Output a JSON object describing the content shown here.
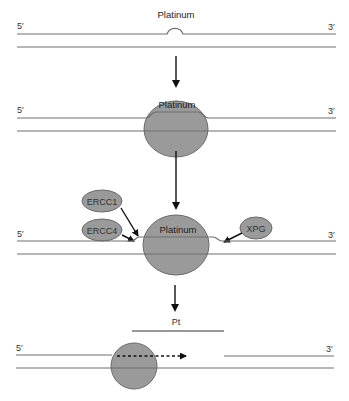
{
  "diagram": {
    "colors": {
      "protein_fill": "#9a9a9a",
      "protein_stroke": "#6a6a6a",
      "strand": "#6e6e6e",
      "arrow": "#111111"
    },
    "steps": [
      {
        "id": "step1-adduct",
        "label": "Platinum",
        "five_prime": "5′",
        "three_prime": "3′"
      },
      {
        "id": "step2-recognition",
        "label": "Platinum",
        "five_prime": "5′",
        "three_prime": "3′"
      },
      {
        "id": "step3-incision",
        "label": "Platinum",
        "five_prime": "5′",
        "three_prime": "3′",
        "proteins": [
          {
            "name": "ERCC1"
          },
          {
            "name": "ERCC4"
          },
          {
            "name": "XPG"
          }
        ]
      },
      {
        "id": "step4-excision-resynthesis",
        "excised_label": "Pt",
        "five_prime": "5′",
        "three_prime": "3′"
      }
    ]
  }
}
